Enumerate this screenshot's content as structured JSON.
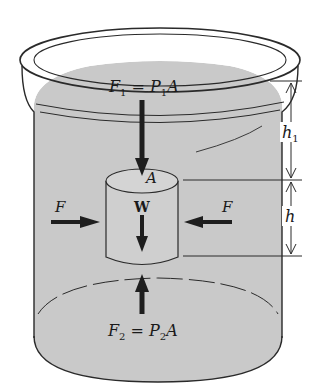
{
  "diagram": {
    "labels": {
      "top_force": {
        "F": "F",
        "F_sub": "1",
        "eq": " = ",
        "P": "P",
        "P_sub": "1",
        "A": "A"
      },
      "bottom_force": {
        "F": "F",
        "F_sub": "2",
        "eq": " = ",
        "P": "P",
        "P_sub": "2",
        "A": "A"
      },
      "area": "A",
      "weight": "W",
      "left_force": "F",
      "right_force": "F",
      "depth_top": {
        "h": "h",
        "sub": "1"
      },
      "height": "h"
    },
    "colors": {
      "fluid": "#c9c9c9",
      "outline": "#2a2a2a",
      "arrow": "#1e1e1e",
      "background": "#ffffff"
    }
  }
}
